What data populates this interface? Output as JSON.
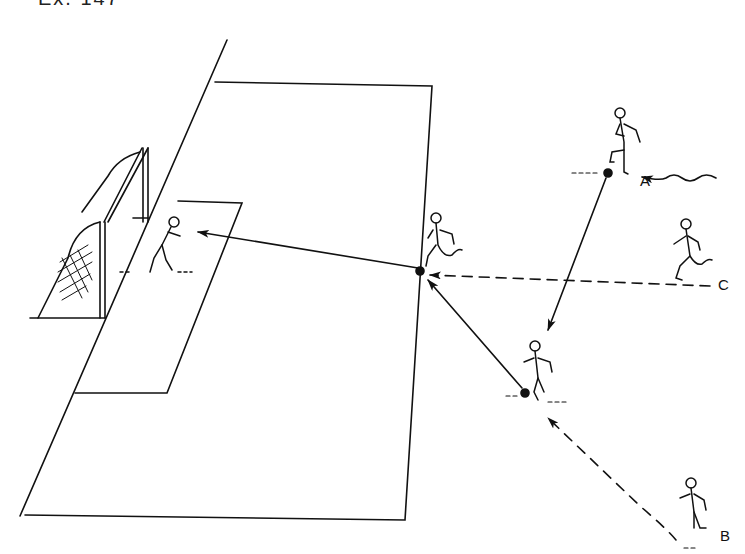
{
  "heading": "Ex. 147",
  "labels": {
    "player_a": "A",
    "player_b": "B",
    "player_c": "C"
  },
  "colors": {
    "ink": "#111111",
    "paper": "#ffffff"
  },
  "diagram": {
    "type": "soccer drill diagram",
    "elements": [
      "goal with net",
      "penalty area",
      "goal area",
      "goalkeeper",
      "striker receiving at penalty-area edge",
      "player A with ball (dribble wavy arrow)",
      "player B running (dashed run arrow)",
      "player C running (dashed run arrow)"
    ],
    "passes": [
      {
        "from": "A",
        "to": "B-position",
        "style": "solid"
      },
      {
        "from": "B-position",
        "to": "striker",
        "style": "solid"
      },
      {
        "from": "striker",
        "to": "goal",
        "style": "solid (shot)"
      }
    ],
    "runs": [
      {
        "player": "C",
        "to": "striker",
        "style": "dashed"
      },
      {
        "player": "B",
        "to": "B-position",
        "style": "dashed"
      }
    ]
  }
}
